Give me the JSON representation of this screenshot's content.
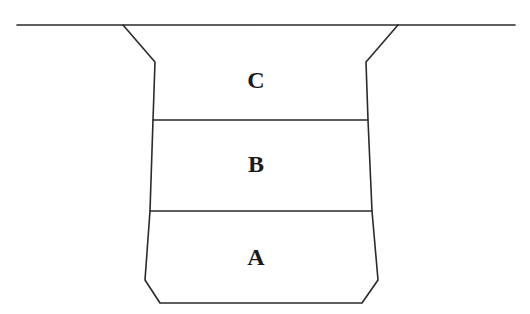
{
  "diagram": {
    "type": "layered-trench-cross-section",
    "layers": [
      {
        "id": "top",
        "label": "C"
      },
      {
        "id": "middle",
        "label": "B"
      },
      {
        "id": "bottom",
        "label": "A"
      }
    ],
    "colors": {
      "line": "#2a2a2a",
      "text": "#1a1a1a",
      "background": "#ffffff"
    }
  }
}
